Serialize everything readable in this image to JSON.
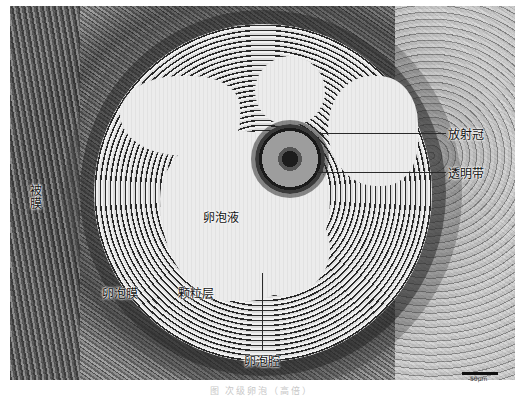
{
  "figure": {
    "type": "histology-micrograph",
    "labels": {
      "corona_radiata": "放射冠",
      "zona_pellucida": "透明带",
      "follicular_fluid": "卵泡液",
      "theca": "卵泡膜",
      "granulosa": "颗粒层",
      "antrum": "卵泡腔",
      "cortex_side": "被膜"
    },
    "scale_bar": {
      "text": "50μm"
    },
    "caption": "图  次级卵泡（高倍）"
  }
}
